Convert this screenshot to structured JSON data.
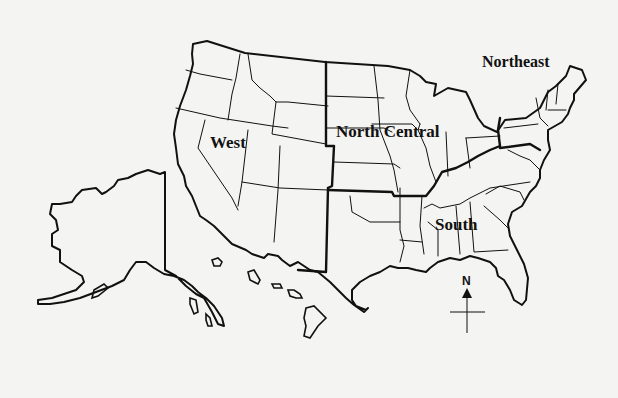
{
  "map": {
    "title": "United States census regions",
    "regions": [
      {
        "name": "West",
        "label": "West"
      },
      {
        "name": "North Central",
        "label": "North Central"
      },
      {
        "name": "Northeast",
        "label": "Northeast"
      },
      {
        "name": "South",
        "label": "South"
      }
    ],
    "compass": {
      "label": "N"
    },
    "colors": {
      "ink": "#111111",
      "paper": "#f4f4f2"
    }
  }
}
